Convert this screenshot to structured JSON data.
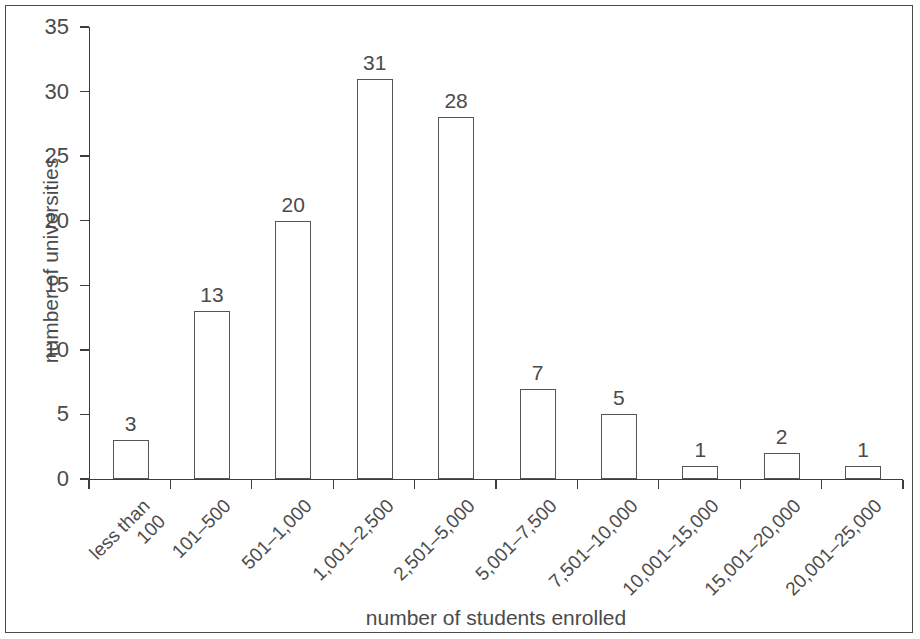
{
  "chart_data": {
    "type": "bar",
    "title": "",
    "xlabel": "number of students enrolled",
    "ylabel": "number of universities",
    "categories": [
      "less than\n100",
      "101–500",
      "501–1,000",
      "1,001–2,500",
      "2,501–5,000",
      "5,001–7,500",
      "7,501–10,000",
      "10,001–15,000",
      "15,001–20,000",
      "20,001–25,000"
    ],
    "values": [
      3,
      13,
      20,
      31,
      28,
      7,
      5,
      1,
      2,
      1
    ],
    "value_labels": [
      "3",
      "13",
      "20",
      "31",
      "28",
      "7",
      "5",
      "1",
      "2",
      "1"
    ],
    "ylim": [
      0,
      35
    ],
    "ytick_values": [
      0,
      5,
      10,
      15,
      20,
      25,
      30,
      35
    ],
    "ytick_labels": [
      "0",
      "5",
      "10",
      "15",
      "20",
      "25",
      "30",
      "35"
    ],
    "grid": false,
    "legend": false,
    "legend_position": "none",
    "bar_fill": "#ffffff",
    "bar_edge": "#555555",
    "axis_color": "#3d3d3d",
    "text_color": "#4b4b4b",
    "frame_color": "#4a4a4a",
    "background": "#ffffff"
  }
}
